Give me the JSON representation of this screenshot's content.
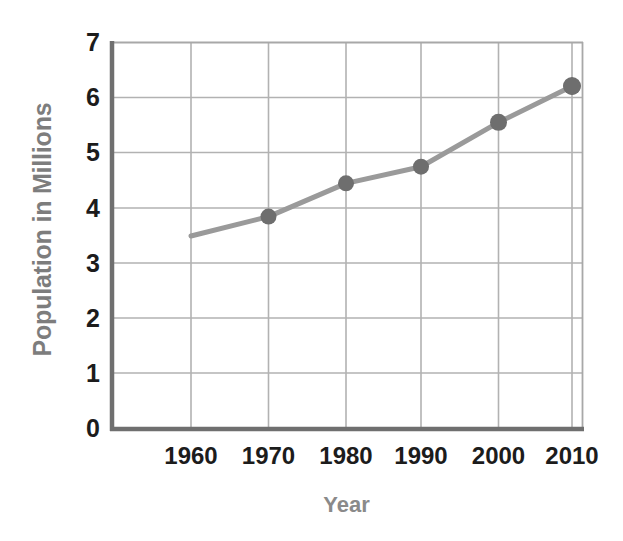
{
  "chart_data": {
    "type": "line",
    "title": "",
    "xlabel": "Year",
    "ylabel": "Population in Millions",
    "x": [
      1960,
      1970,
      1980,
      1990,
      2000,
      2010
    ],
    "categories": [
      "1960",
      "1970",
      "1980",
      "1990",
      "2000",
      "2010"
    ],
    "values": [
      3.5,
      3.85,
      4.45,
      4.75,
      5.55,
      6.2
    ],
    "series": [
      {
        "name": "Population",
        "values": [
          3.5,
          3.85,
          4.45,
          4.75,
          5.55,
          6.2
        ]
      }
    ],
    "xlim": [
      1955,
      2012
    ],
    "ylim": [
      0,
      7
    ],
    "y_ticks": [
      0,
      1,
      2,
      3,
      4,
      5,
      6,
      7
    ],
    "y_tick_labels": [
      "0",
      "1",
      "2",
      "3",
      "4",
      "5",
      "6",
      "7"
    ],
    "x_ticks": [
      1960,
      1970,
      1980,
      1990,
      2000,
      2010
    ],
    "x_tick_labels": [
      "1960",
      "1970",
      "1980",
      "1990",
      "2000",
      "2010"
    ],
    "grid": true,
    "grid_axis": "both",
    "legend": false,
    "legend_position": "none",
    "marker": "circle",
    "colors": {
      "line": "#9a9a9a",
      "marker": "#6e6e6e",
      "gridline": "#b0b0b0",
      "axis": "#6b6b6b",
      "tick_label": "#1c1c1c",
      "axis_title": "#858585",
      "background": "#ffffff"
    }
  },
  "axes": {
    "y_title": "Population in Millions",
    "x_title": "Year"
  },
  "ticks": {
    "y": [
      "7",
      "6",
      "5",
      "4",
      "3",
      "2",
      "1",
      "0"
    ],
    "x": [
      "1960",
      "1970",
      "1980",
      "1990",
      "2000",
      "2010"
    ]
  }
}
